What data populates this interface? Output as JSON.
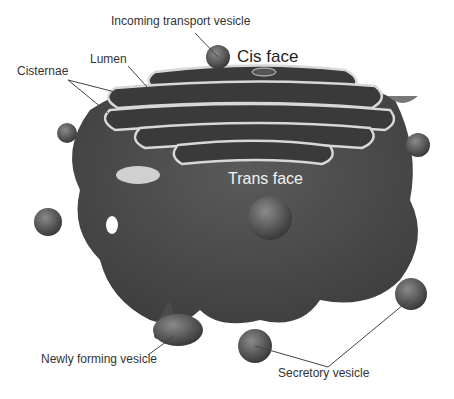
{
  "diagram": {
    "labels": {
      "incoming": "Incoming transport vesicle",
      "cis_face": "Cis face",
      "lumen": "Lumen",
      "cisternae": "Cisternae",
      "trans_face": "Trans face",
      "newly_forming": "Newly forming vesicle",
      "secretory": "Secretory vesicle"
    },
    "colors": {
      "body": "#4a4a4a",
      "membrane": "#d8d8d8",
      "background": "#ffffff"
    }
  }
}
